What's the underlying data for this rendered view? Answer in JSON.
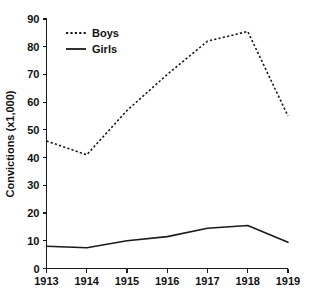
{
  "chart_data": {
    "type": "line",
    "title": "",
    "subtitle": "",
    "xlabel": "",
    "ylabel": "Convictions (x1,000)",
    "x": [
      1913,
      1914,
      1915,
      1916,
      1917,
      1918,
      1919
    ],
    "categories": [
      "1913",
      "1914",
      "1915",
      "1916",
      "1917",
      "1918",
      "1919"
    ],
    "xlim": [
      1913,
      1919
    ],
    "ylim": [
      0,
      90
    ],
    "y_ticks": [
      0,
      10,
      20,
      30,
      40,
      50,
      60,
      70,
      80,
      90
    ],
    "y_tick_labels": [
      "0",
      "10",
      "20",
      "30",
      "40",
      "50",
      "60",
      "70",
      "80",
      "90"
    ],
    "x_tick_labels": [
      "1913",
      "1914",
      "1915",
      "1916",
      "1917",
      "1918",
      "1919"
    ],
    "grid": false,
    "legend_position": "top-left-inside",
    "series": [
      {
        "name": "Boys",
        "style": "dashed",
        "color": "#1a1a1a",
        "values": [
          46,
          41,
          57,
          70,
          82,
          85.5,
          55
        ]
      },
      {
        "name": "Girls",
        "style": "solid",
        "color": "#1a1a1a",
        "values": [
          8,
          7.5,
          10,
          11.5,
          14.5,
          15.5,
          9.5
        ]
      }
    ],
    "annotations": []
  },
  "legend": {
    "entries": [
      {
        "label": "Boys"
      },
      {
        "label": "Girls"
      }
    ]
  },
  "axes": {
    "y_title": "Convictions (x1,000)"
  },
  "colors": {
    "ink": "#1a1a1a",
    "background": "#ffffff"
  }
}
